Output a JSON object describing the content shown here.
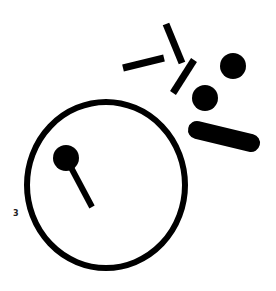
{
  "canvas": {
    "width": 276,
    "height": 291,
    "background": "#ffffff",
    "ink": "#000000"
  },
  "label": {
    "text": "3",
    "x": 13,
    "y": 209
  },
  "shapes": {
    "big_circle": {
      "cx": 106,
      "cy": 185,
      "rx": 79,
      "ry": 83,
      "stroke": 6
    },
    "inner_dot": {
      "cx": 66,
      "cy": 158,
      "r": 13
    },
    "hand": {
      "x1": 66,
      "y1": 158,
      "x2": 92,
      "y2": 207,
      "stroke": 6
    },
    "bar_left": {
      "x1": 123,
      "y1": 68,
      "x2": 164,
      "y2": 58,
      "stroke": 7
    },
    "bar_upper": {
      "x1": 166,
      "y1": 24,
      "x2": 182,
      "y2": 63,
      "stroke": 7
    },
    "bar_diag": {
      "x1": 194,
      "y1": 60,
      "x2": 173,
      "y2": 93,
      "stroke": 7
    },
    "dot_right": {
      "cx": 233,
      "cy": 66,
      "r": 13
    },
    "dot_mid": {
      "cx": 205,
      "cy": 98,
      "r": 13
    },
    "pill": {
      "x1": 197,
      "y1": 130,
      "x2": 251,
      "y2": 143,
      "stroke": 18
    }
  }
}
